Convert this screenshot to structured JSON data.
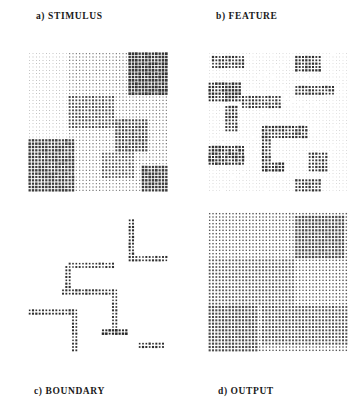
{
  "figure": {
    "background_color": "#ffffff",
    "ink_color": "#222222",
    "panel_size_px": 140,
    "grid_cells": 42,
    "panels": [
      {
        "id": "a",
        "index_label": "a)",
        "title": "STIMULUS",
        "label": "a) STIMULUS",
        "label_position": "top",
        "render": "dots",
        "description": "Dense array of small dots whose element sizes vary by region, forming texture-defined squares."
      },
      {
        "id": "b",
        "index_label": "b)",
        "title": "FEATURE",
        "label": "b) FEATURE",
        "label_position": "top",
        "render": "dots",
        "description": "Feature map: dark clusters concentrated at texture region borders."
      },
      {
        "id": "c",
        "index_label": "c)",
        "title": "BOUNDARY",
        "label": "c) BOUNDARY",
        "label_position": "bottom",
        "render": "dots",
        "description": "Sparse boundary contours on white background tracing region edges."
      },
      {
        "id": "d",
        "index_label": "d)",
        "title": "OUTPUT",
        "label": "d) OUTPUT",
        "label_position": "bottom",
        "render": "dots",
        "description": "Filled output regions with uniform dot size per surface."
      }
    ]
  },
  "chart_data": {
    "type": "heatmap",
    "title": "",
    "xlabel": "",
    "ylabel": "",
    "grid": 42,
    "panel_titles": [
      "a) STIMULUS",
      "b) FEATURE",
      "c) BOUNDARY",
      "d) OUTPUT"
    ],
    "regions": {
      "stimulus": [
        {
          "x": 0,
          "y": 0,
          "w": 42,
          "h": 42,
          "size": 0.3,
          "note": "background fine texture"
        },
        {
          "x": 0,
          "y": 0,
          "w": 12,
          "h": 26,
          "size": 0.17,
          "note": "upper-left fine"
        },
        {
          "x": 30,
          "y": 0,
          "w": 12,
          "h": 13,
          "size": 0.72,
          "note": "upper-right coarse"
        },
        {
          "x": 12,
          "y": 13,
          "w": 14,
          "h": 10,
          "size": 0.52,
          "note": "central block"
        },
        {
          "x": 26,
          "y": 20,
          "w": 10,
          "h": 10,
          "size": 0.6,
          "note": "mid-right block"
        },
        {
          "x": 0,
          "y": 26,
          "w": 14,
          "h": 16,
          "size": 0.66,
          "note": "lower-left coarse"
        },
        {
          "x": 22,
          "y": 30,
          "w": 10,
          "h": 8,
          "size": 0.5,
          "note": "lower-mid block"
        },
        {
          "x": 34,
          "y": 34,
          "w": 8,
          "h": 8,
          "size": 0.68,
          "note": "lower-right block"
        }
      ],
      "feature": [
        {
          "x": 0,
          "y": 0,
          "w": 42,
          "h": 42,
          "size": 0.12,
          "note": "sparse background"
        },
        {
          "x": 1,
          "y": 1,
          "w": 10,
          "h": 4,
          "size": 0.55
        },
        {
          "x": 26,
          "y": 1,
          "w": 8,
          "h": 5,
          "size": 0.6
        },
        {
          "x": 0,
          "y": 9,
          "w": 10,
          "h": 6,
          "size": 0.62
        },
        {
          "x": 26,
          "y": 10,
          "w": 12,
          "h": 3,
          "size": 0.58
        },
        {
          "x": 10,
          "y": 13,
          "w": 12,
          "h": 4,
          "size": 0.55
        },
        {
          "x": 5,
          "y": 16,
          "w": 4,
          "h": 8,
          "size": 0.58
        },
        {
          "x": 16,
          "y": 22,
          "w": 14,
          "h": 4,
          "size": 0.6
        },
        {
          "x": 0,
          "y": 28,
          "w": 11,
          "h": 6,
          "size": 0.62
        },
        {
          "x": 16,
          "y": 26,
          "w": 3,
          "h": 10,
          "size": 0.56
        },
        {
          "x": 17,
          "y": 33,
          "w": 6,
          "h": 3,
          "size": 0.64
        },
        {
          "x": 30,
          "y": 30,
          "w": 6,
          "h": 6,
          "size": 0.55
        },
        {
          "x": 26,
          "y": 38,
          "w": 8,
          "h": 4,
          "size": 0.58
        }
      ],
      "boundary": [
        {
          "x": 30,
          "y": 2,
          "w": 2,
          "h": 12,
          "size": 0.55,
          "note": "vertical edge"
        },
        {
          "x": 30,
          "y": 13,
          "w": 12,
          "h": 2,
          "size": 0.52,
          "note": "horizontal edge"
        },
        {
          "x": 12,
          "y": 15,
          "w": 14,
          "h": 1.5,
          "size": 0.5
        },
        {
          "x": 11,
          "y": 16,
          "w": 1.5,
          "h": 8,
          "size": 0.52
        },
        {
          "x": 10,
          "y": 23,
          "w": 16,
          "h": 1.5,
          "size": 0.55
        },
        {
          "x": 25,
          "y": 23,
          "w": 1.5,
          "h": 14,
          "size": 0.5
        },
        {
          "x": 0,
          "y": 29,
          "w": 14,
          "h": 1.5,
          "size": 0.55
        },
        {
          "x": 13,
          "y": 29,
          "w": 1.5,
          "h": 13,
          "size": 0.52
        },
        {
          "x": 22,
          "y": 35,
          "w": 8,
          "h": 2,
          "size": 0.62
        },
        {
          "x": 33,
          "y": 39,
          "w": 8,
          "h": 1.5,
          "size": 0.55
        }
      ],
      "output": [
        {
          "x": 0,
          "y": 0,
          "w": 42,
          "h": 42,
          "size": 0.4,
          "note": "base surface"
        },
        {
          "x": 26,
          "y": 1,
          "w": 15,
          "h": 13,
          "size": 0.62,
          "note": "upper-right filled"
        },
        {
          "x": 0,
          "y": 14,
          "w": 26,
          "h": 14,
          "size": 0.5,
          "note": "central filled"
        },
        {
          "x": 0,
          "y": 28,
          "w": 15,
          "h": 14,
          "size": 0.6,
          "note": "lower-left filled"
        },
        {
          "x": 16,
          "y": 28,
          "w": 26,
          "h": 12,
          "size": 0.55,
          "note": "lower-right filled"
        }
      ]
    }
  }
}
